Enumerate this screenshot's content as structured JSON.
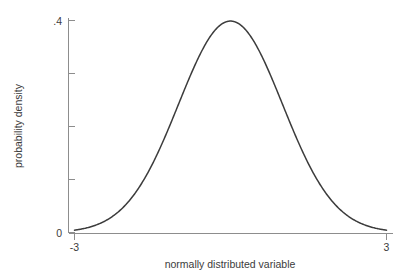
{
  "chart_data": {
    "type": "line",
    "title": "",
    "subtitle": "",
    "xlabel": "normally distributed variable",
    "ylabel": "probability density",
    "xlim": [
      -3,
      3
    ],
    "ylim": [
      0,
      0.4
    ],
    "grid": false,
    "legend": null,
    "legend_position": "none",
    "annotations": [],
    "x_tick_labels": [
      "-3",
      "3"
    ],
    "x_tick_values": [
      -3,
      3
    ],
    "y_tick_labels": [
      "0",
      ".4"
    ],
    "y_tick_values": [
      0,
      0.4
    ],
    "y_minor_tick_values": [
      0.1,
      0.2,
      0.3
    ],
    "series": [
      {
        "name": "standard normal density",
        "formula": "phi(x) = (1/sqrt(2*pi)) * exp(-x^2/2)",
        "x": [
          -3.0,
          -2.8,
          -2.6,
          -2.4,
          -2.2,
          -2.0,
          -1.8,
          -1.6,
          -1.4,
          -1.2,
          -1.0,
          -0.8,
          -0.6,
          -0.4,
          -0.2,
          0.0,
          0.2,
          0.4,
          0.6,
          0.8,
          1.0,
          1.2,
          1.4,
          1.6,
          1.8,
          2.0,
          2.2,
          2.4,
          2.6,
          2.8,
          3.0
        ],
        "y": [
          0.0044,
          0.0079,
          0.0136,
          0.0224,
          0.0355,
          0.054,
          0.079,
          0.1109,
          0.1497,
          0.1942,
          0.242,
          0.2897,
          0.3332,
          0.3683,
          0.391,
          0.3989,
          0.391,
          0.3683,
          0.3332,
          0.2897,
          0.242,
          0.1942,
          0.1497,
          0.1109,
          0.079,
          0.054,
          0.0355,
          0.0224,
          0.0136,
          0.0079,
          0.0044
        ]
      }
    ],
    "peak": {
      "x": 0,
      "y": 0.3989
    }
  },
  "colors": {
    "background": "#ffffff",
    "curve": "#3c3c3c",
    "axis": "#8d8d8d",
    "text": "#3b3b3b"
  }
}
